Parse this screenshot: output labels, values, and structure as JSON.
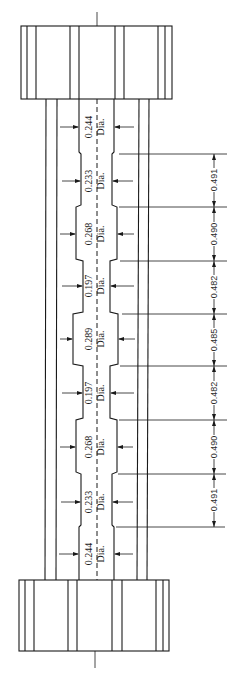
{
  "drawing": {
    "type": "tensile specimen engineering drawing (stepped shaft with end grips)",
    "sections": [
      {
        "diameter": "0.244",
        "unit_label": "Dia."
      },
      {
        "diameter": "0.233",
        "unit_label": "Dia."
      },
      {
        "diameter": "0.268",
        "unit_label": "Dia."
      },
      {
        "diameter": "0.197",
        "unit_label": "Dia."
      },
      {
        "diameter": "0.289",
        "unit_label": "Dia."
      },
      {
        "diameter": "0.197",
        "unit_label": "Dia."
      },
      {
        "diameter": "0.268",
        "unit_label": "Dia."
      },
      {
        "diameter": "0.233",
        "unit_label": "Dia."
      },
      {
        "diameter": "0.244",
        "unit_label": "Dia."
      }
    ],
    "lengths": [
      "0.491",
      "0.490",
      "0.482",
      "0.485",
      "0.482",
      "0.490",
      "0.491"
    ]
  },
  "colors": {
    "line": "#1a1a1a",
    "background": "#ffffff"
  }
}
